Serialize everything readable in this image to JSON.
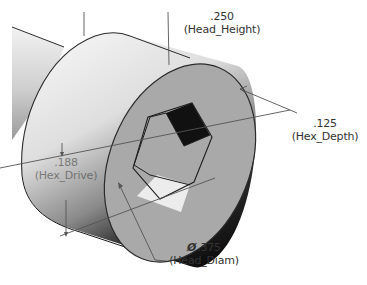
{
  "drawing": {
    "type": "isometric CAD view",
    "part": "socket head cap screw head",
    "colors": {
      "background": "#ffffff",
      "edge": "#2b2b2b",
      "face": "#a9a9a9",
      "cylinder_light": "#e9e9e9",
      "cylinder_dark": "#1a1a1a",
      "hex_shadow": "#111111",
      "hex_bottom": "#ececec",
      "dimension_line": "#555555",
      "text": "#333333"
    }
  },
  "dimensions": {
    "head_height": {
      "value": ".250",
      "name": "(Head_Height)"
    },
    "hex_depth": {
      "value": ".125",
      "name": "(Hex_Depth)"
    },
    "head_diam": {
      "symbol": "Ø",
      "value": ".375",
      "name": "(Head_Diam)"
    },
    "hex_drive": {
      "value": ".188",
      "name": "(Hex_Drive)"
    }
  }
}
